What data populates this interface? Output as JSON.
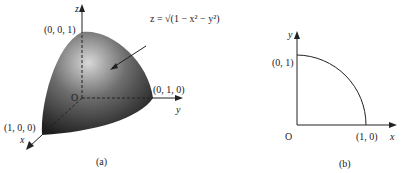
{
  "figure_a": {
    "caption": "(a)",
    "axes": {
      "x": "x",
      "y": "y",
      "z": "z"
    },
    "origin": "O",
    "points": {
      "z_top": "(0, 0, 1)",
      "y_end": "(0, 1, 0)",
      "x_end": "(1, 0, 0)"
    },
    "surface_label": "z = √(1 − x² − y²)"
  },
  "figure_b": {
    "caption": "(b)",
    "axes": {
      "x": "x",
      "y": "y"
    },
    "origin": "O",
    "points": {
      "y_end": "(0, 1)",
      "x_end": "(1, 0)"
    }
  },
  "colors": {
    "surface_dark": "#1e1e1e",
    "surface_light": "#d8d8d8",
    "ink": "#222222"
  }
}
